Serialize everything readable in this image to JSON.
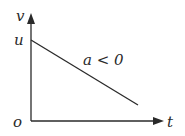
{
  "diagram": {
    "type": "velocity-time graph",
    "axes": {
      "y_label": "v",
      "x_label": "t",
      "origin_label": "o"
    },
    "intercept_label": "u",
    "line_label": "a < 0",
    "line": {
      "start": {
        "t": 0,
        "v": "u"
      },
      "slope": "negative"
    },
    "colors": {
      "stroke": "#2a2a2a",
      "background": "#ffffff"
    }
  }
}
